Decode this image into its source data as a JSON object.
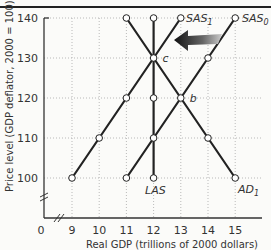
{
  "chart_data": {
    "type": "line",
    "title": "",
    "xlabel": "Real GDP (trillions of 2000 dollars)",
    "ylabel": "Price level (GDP deflator, 2000 = 100)",
    "x_ticks": [
      "0",
      "9",
      "10",
      "11",
      "12",
      "13",
      "14",
      "15"
    ],
    "y_ticks": [
      "100",
      "110",
      "120",
      "130",
      "140"
    ],
    "xlim": [
      9,
      15.5
    ],
    "ylim": [
      100,
      140
    ],
    "grid": true,
    "axis_breaks": [
      "x",
      "y"
    ],
    "series": [
      {
        "name": "SAS1",
        "label": "SAS",
        "sub": "1",
        "points": [
          [
            9,
            100
          ],
          [
            10,
            110
          ],
          [
            11,
            120
          ],
          [
            12,
            130
          ],
          [
            13,
            140
          ]
        ]
      },
      {
        "name": "SAS0",
        "label": "SAS",
        "sub": "0",
        "points": [
          [
            11,
            100
          ],
          [
            12,
            110
          ],
          [
            13,
            120
          ],
          [
            14,
            130
          ],
          [
            15,
            140
          ]
        ]
      },
      {
        "name": "AD1",
        "label": "AD",
        "sub": "1",
        "points": [
          [
            11,
            140
          ],
          [
            12,
            130
          ],
          [
            13,
            120
          ],
          [
            14,
            110
          ],
          [
            15,
            100
          ]
        ]
      },
      {
        "name": "LAS",
        "label": "LAS",
        "sub": "",
        "points": [
          [
            12,
            100
          ],
          [
            12,
            110
          ],
          [
            12,
            120
          ],
          [
            12,
            130
          ],
          [
            12,
            140
          ]
        ]
      }
    ],
    "annotations": [
      {
        "text": "c",
        "x": 12,
        "y": 130
      },
      {
        "text": "b",
        "x": 13,
        "y": 120
      },
      {
        "text": "arrow",
        "from": [
          14.5,
          136
        ],
        "to": [
          13.2,
          136
        ],
        "meaning": "SAS shifts leftward from SAS0 to SAS1"
      }
    ]
  }
}
